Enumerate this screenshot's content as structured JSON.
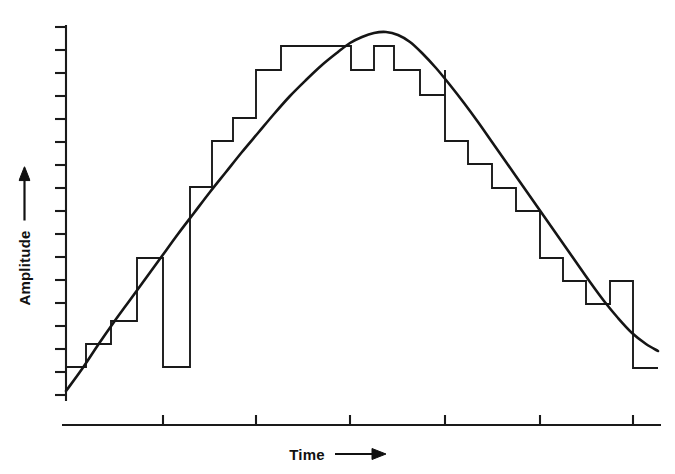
{
  "figure": {
    "background_color": "#ffffff",
    "ink_color": "#1a1a1a",
    "width": 675,
    "height": 474
  },
  "axes": {
    "y": {
      "label": "Amplitude",
      "arrow_icon": "arrow-up-icon",
      "arrow_direction": "up",
      "axis_x": 66,
      "top": 27,
      "bottom": 400,
      "tick_count": 17,
      "tick_positions": [
        27,
        50,
        73,
        96,
        119,
        142,
        165,
        188,
        211,
        234,
        257,
        280,
        303,
        326,
        349,
        372,
        395
      ],
      "tick_length": 11,
      "tick_side": "left"
    },
    "x": {
      "label": "Time",
      "arrow_icon": "arrow-right-icon",
      "arrow_direction": "right",
      "axis_y": 425,
      "left": 62,
      "right": 660,
      "tick_positions": [
        163,
        256,
        350,
        445,
        540,
        633
      ],
      "tick_length": 10,
      "tick_side": "up"
    }
  },
  "chart_data": {
    "type": "line",
    "title": "",
    "subtitle": "",
    "xlabel": "Time",
    "ylabel": "Amplitude",
    "grid": false,
    "legend": "none",
    "xlim": [
      0,
      1
    ],
    "ylim": [
      0,
      1
    ],
    "axis_tick_labels": {
      "x": [],
      "y": []
    },
    "series": [
      {
        "name": "Analog signal",
        "type": "line",
        "style": "smooth-curve",
        "stroke": "#151515",
        "stroke_width": 2.6,
        "description": "Smooth sinusoidal arch rising from lower left, peaking near center, falling to lower right",
        "points_px": [
          [
            66,
            391
          ],
          [
            82,
            369
          ],
          [
            98,
            345
          ],
          [
            114,
            322
          ],
          [
            130,
            300
          ],
          [
            146,
            278
          ],
          [
            162,
            256
          ],
          [
            178,
            234
          ],
          [
            194,
            213
          ],
          [
            210,
            192
          ],
          [
            226,
            172
          ],
          [
            242,
            152
          ],
          [
            258,
            133
          ],
          [
            274,
            114
          ],
          [
            290,
            96
          ],
          [
            306,
            80
          ],
          [
            322,
            65
          ],
          [
            338,
            52
          ],
          [
            350,
            43
          ],
          [
            362,
            37
          ],
          [
            374,
            33
          ],
          [
            386,
            32
          ],
          [
            398,
            35
          ],
          [
            410,
            42
          ],
          [
            422,
            53
          ],
          [
            436,
            68
          ],
          [
            450,
            85
          ],
          [
            464,
            103
          ],
          [
            478,
            122
          ],
          [
            492,
            142
          ],
          [
            506,
            162
          ],
          [
            520,
            182
          ],
          [
            534,
            202
          ],
          [
            548,
            222
          ],
          [
            562,
            242
          ],
          [
            576,
            262
          ],
          [
            590,
            282
          ],
          [
            604,
            301
          ],
          [
            618,
            318
          ],
          [
            632,
            333
          ],
          [
            646,
            344
          ],
          [
            658,
            351
          ]
        ]
      },
      {
        "name": "Quantized staircase approximation",
        "type": "step",
        "style": "staircase",
        "stroke": "#1a1a1a",
        "stroke_width": 1.9,
        "description": "Rectangular sample-and-hold steps tracking the analog curve; each step is a constant-amplitude hold between sample instants",
        "steps_px": [
          {
            "x0": 66,
            "x1": 86,
            "y": 367
          },
          {
            "x0": 86,
            "x1": 111,
            "y": 344
          },
          {
            "x0": 111,
            "x1": 137,
            "y": 321
          },
          {
            "x0": 137,
            "x1": 163,
            "y": 258
          },
          {
            "x0": 163,
            "x1": 190,
            "y": 367
          },
          {
            "x0": 190,
            "x1": 190,
            "y": 187
          },
          {
            "x0": 190,
            "x1": 212,
            "y": 187
          },
          {
            "x0": 212,
            "x1": 233,
            "y": 141
          },
          {
            "x0": 233,
            "x1": 256,
            "y": 118
          },
          {
            "x0": 256,
            "x1": 281,
            "y": 70
          },
          {
            "x0": 281,
            "x1": 351,
            "y": 46
          },
          {
            "x0": 351,
            "x1": 374,
            "y": 70
          },
          {
            "x0": 374,
            "x1": 394,
            "y": 46
          },
          {
            "x0": 394,
            "x1": 420,
            "y": 70
          },
          {
            "x0": 420,
            "x1": 445,
            "y": 95
          },
          {
            "x0": 445,
            "x1": 445,
            "y": 70
          },
          {
            "x0": 445,
            "x1": 468,
            "y": 141
          },
          {
            "x0": 468,
            "x1": 492,
            "y": 164
          },
          {
            "x0": 492,
            "x1": 516,
            "y": 188
          },
          {
            "x0": 516,
            "x1": 540,
            "y": 211
          },
          {
            "x0": 540,
            "x1": 563,
            "y": 258
          },
          {
            "x0": 563,
            "x1": 586,
            "y": 281
          },
          {
            "x0": 586,
            "x1": 610,
            "y": 304
          },
          {
            "x0": 610,
            "x1": 633,
            "y": 281
          },
          {
            "x0": 633,
            "x1": 658,
            "y": 368
          }
        ]
      }
    ]
  },
  "icons": {
    "arrow_up": "arrow-up-icon",
    "arrow_right": "arrow-right-icon"
  }
}
